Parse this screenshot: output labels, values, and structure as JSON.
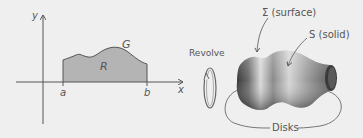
{
  "left_plot": {
    "y_axis_label": "y",
    "x_axis_label": "x",
    "curve_label": "G",
    "region_label": "R",
    "x_tick_a": "a",
    "x_tick_b": "b"
  },
  "revolve": {
    "label": "Revolve"
  },
  "solid": {
    "surface_label": "Σ (surface)",
    "solid_label": "S (solid)",
    "disks_label": "Disks"
  },
  "colors": {
    "background": "#efefef",
    "region_fill": "#b4b4b4",
    "axis": "#555555",
    "solid_dark": "#444444",
    "solid_light": "#d8d8d8"
  }
}
